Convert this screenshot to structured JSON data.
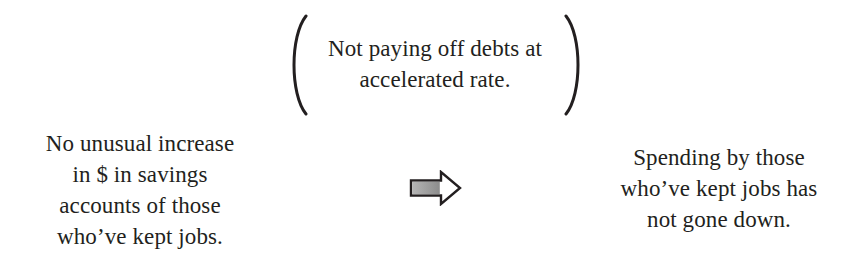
{
  "diagram": {
    "premise": {
      "lines": [
        "No unusual increase",
        "in $ in savings",
        "accounts of those",
        "who’ve kept jobs."
      ]
    },
    "parenthetical_note": {
      "lines": [
        "Not paying off debts at",
        "accelerated rate."
      ]
    },
    "arrow": {
      "icon": "right-block-arrow-icon",
      "direction": "right",
      "shaft_fill": "#9a9a9a",
      "outline": "#231f20"
    },
    "conclusion": {
      "lines": [
        "Spending by those",
        "who’ve kept jobs has",
        "not gone down."
      ]
    },
    "colors": {
      "text": "#231f20",
      "background": "#ffffff"
    }
  }
}
